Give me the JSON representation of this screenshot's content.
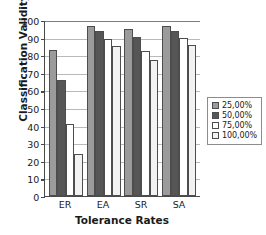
{
  "chart_data": {
    "type": "bar",
    "title": "",
    "xlabel": "Tolerance Rates",
    "ylabel": "Classification Validity",
    "categories": [
      "ER",
      "EA",
      "SR",
      "SA"
    ],
    "series": [
      {
        "name": "25,00%",
        "color": "#9b9b9b",
        "values": [
          83.0,
          96.5,
          95.0,
          96.5
        ]
      },
      {
        "name": "50,00%",
        "color": "#565656",
        "values": [
          66.0,
          93.5,
          90.5,
          93.5
        ]
      },
      {
        "name": "75,00%",
        "color": "#ffffff",
        "values": [
          41.0,
          89.0,
          82.5,
          89.5
        ]
      },
      {
        "name": "100,00%",
        "color": "#f2f2f2",
        "values": [
          24.0,
          85.5,
          77.0,
          86.0
        ]
      }
    ],
    "ylim": [
      0,
      100
    ],
    "yticks": [
      "0",
      "10",
      "20",
      "30",
      "40",
      "50",
      "60",
      "70",
      "80",
      "90",
      "100"
    ],
    "ytick_values": [
      0,
      10,
      20,
      30,
      40,
      50,
      60,
      70,
      80,
      90,
      100
    ],
    "grid": true,
    "grid_axis": "y",
    "legend_position": "right-outside",
    "legend_entries": [
      "25,00%",
      "50,00%",
      "75,00%",
      "100,00%"
    ]
  }
}
